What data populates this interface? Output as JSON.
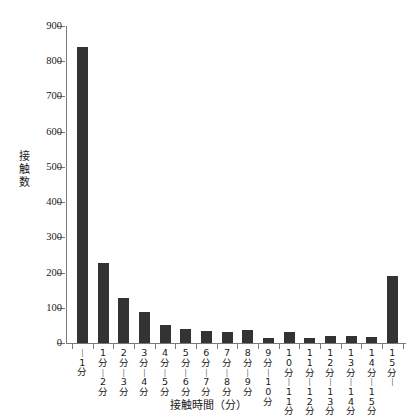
{
  "chart_data": {
    "type": "bar",
    "title": "",
    "xlabel": "接触時間（分）",
    "ylabel": "接触数",
    "ylim": [
      0,
      900
    ],
    "yticks": [
      0,
      100,
      200,
      300,
      400,
      500,
      600,
      700,
      800,
      900
    ],
    "grid": false,
    "legend": null,
    "bar_color": "#333333",
    "axis_color": "#7a7a7a",
    "categories": [
      "〜1分",
      "1分〜2分",
      "2分〜3分",
      "3分〜4分",
      "4分〜5分",
      "5分〜6分",
      "6分〜7分",
      "7分〜8分",
      "8分〜9分",
      "9分〜10分",
      "10分〜11分",
      "11分〜12分",
      "12分〜13分",
      "13分〜14分",
      "14分〜15分",
      "15分〜"
    ],
    "category_parts": [
      [
        "",
        "〜",
        "1分"
      ],
      [
        "1分",
        "〜",
        "2分"
      ],
      [
        "2分",
        "〜",
        "3分"
      ],
      [
        "3分",
        "〜",
        "4分"
      ],
      [
        "4分",
        "〜",
        "5分"
      ],
      [
        "5分",
        "〜",
        "6分"
      ],
      [
        "6分",
        "〜",
        "7分"
      ],
      [
        "7分",
        "〜",
        "8分"
      ],
      [
        "8分",
        "〜",
        "9分"
      ],
      [
        "9分",
        "〜",
        "10分"
      ],
      [
        "10分",
        "〜",
        "11分"
      ],
      [
        "11分",
        "〜",
        "12分"
      ],
      [
        "12分",
        "〜",
        "13分"
      ],
      [
        "13分",
        "〜",
        "14分"
      ],
      [
        "14分",
        "〜",
        "15分"
      ],
      [
        "15分",
        "〜",
        ""
      ]
    ],
    "values": [
      840,
      228,
      128,
      88,
      52,
      40,
      35,
      32,
      36,
      14,
      30,
      14,
      20,
      20,
      18,
      190
    ]
  }
}
